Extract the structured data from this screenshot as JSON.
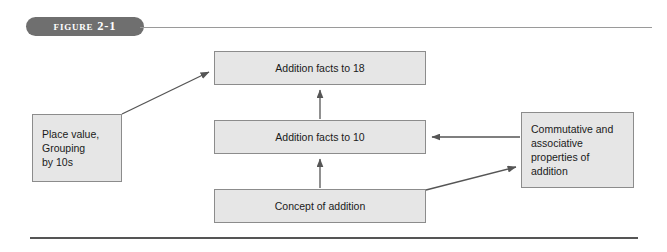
{
  "figure": {
    "label": "Figure 2-1",
    "caption_rule": "top-rule",
    "bottom_rule": "bottom-rule"
  },
  "colors": {
    "pill_background": "#6f6f6f",
    "pill_text": "#ffffff",
    "box_fill": "#e6e6e6",
    "box_border": "#8c8c8c",
    "connector": "#555555",
    "page_background": "#ffffff"
  },
  "diagram": {
    "type": "flowchart",
    "nodes": [
      {
        "id": "place-value",
        "label": "Place value,\nGrouping\nby 10s",
        "align": "left",
        "x": 32,
        "y": 114,
        "w": 90,
        "h": 68
      },
      {
        "id": "addition-facts-18",
        "label": "Addition facts to 18",
        "align": "center",
        "x": 214,
        "y": 51,
        "w": 212,
        "h": 34
      },
      {
        "id": "addition-facts-10",
        "label": "Addition facts to 10",
        "align": "center",
        "x": 214,
        "y": 120,
        "w": 212,
        "h": 34
      },
      {
        "id": "concept-of-addition",
        "label": "Concept of addition",
        "align": "center",
        "x": 214,
        "y": 189,
        "w": 212,
        "h": 34
      },
      {
        "id": "commutative-associative",
        "label": "Commutative and\nassociative\nproperties of\naddition",
        "align": "left",
        "x": 521,
        "y": 112,
        "w": 113,
        "h": 76
      }
    ],
    "edges": [
      {
        "id": "place-to-facts18",
        "from": "place-value",
        "to": "addition-facts-18",
        "direction": "diagonal-up-right"
      },
      {
        "id": "facts10-to-facts18",
        "from": "addition-facts-10",
        "to": "addition-facts-18",
        "direction": "up"
      },
      {
        "id": "concept-to-facts10",
        "from": "concept-of-addition",
        "to": "addition-facts-10",
        "direction": "up"
      },
      {
        "id": "props-to-facts10",
        "from": "commutative-associative",
        "to": "addition-facts-10",
        "direction": "left"
      },
      {
        "id": "concept-to-props",
        "from": "concept-of-addition",
        "to": "commutative-associative",
        "direction": "diagonal-up-right"
      }
    ]
  }
}
